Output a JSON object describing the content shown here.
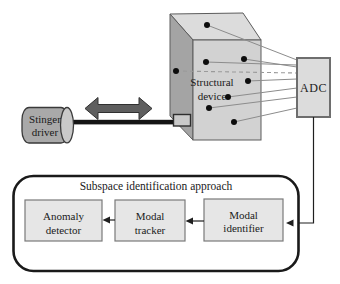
{
  "figure": {
    "stinger_driver": {
      "line1": "Stinger",
      "line2": "driver"
    },
    "structural_device": {
      "line1": "Structural",
      "line2": "device"
    },
    "adc": {
      "label": "ADC"
    },
    "sensor_count": 8,
    "subspace": {
      "title": "Subspace identification approach",
      "anomaly_detector": {
        "line1": "Anomaly",
        "line2": "detector"
      },
      "modal_tracker": {
        "line1": "Modal",
        "line2": "tracker"
      },
      "modal_identifier": {
        "line1": "Modal",
        "line2": "identifier"
      }
    }
  },
  "colors": {
    "device_front": "#d2d2d2",
    "device_top": "#dcdcdc",
    "device_side": "#a4a4a4",
    "adc_fill": "#dcdcdc",
    "module_fill": "#e6e6e6",
    "cylinder_body": "#a9a9a9",
    "cylinder_cap": "#c9c9c9",
    "excitation_arrow": "#5e5e5e",
    "connector_fill": "#c9c9c9"
  }
}
